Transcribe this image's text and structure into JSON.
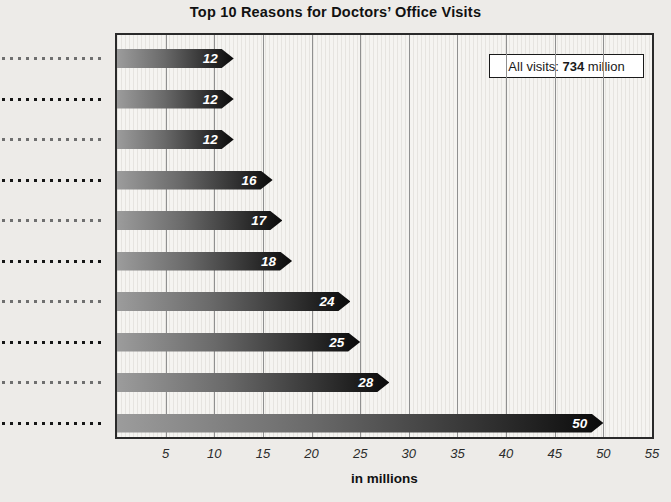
{
  "chart_data": {
    "type": "bar",
    "orientation": "horizontal",
    "title": "Top 10 Reasons for Doctors’ Office Visits",
    "values": [
      12,
      12,
      12,
      16,
      17,
      18,
      24,
      25,
      28,
      50
    ],
    "bar_value_labels": [
      "12",
      "12",
      "12",
      "16",
      "17",
      "18",
      "24",
      "25",
      "28",
      "50"
    ],
    "category_labels_visible": false,
    "category_leader_rows": 10,
    "x_ticks": [
      5,
      10,
      15,
      20,
      25,
      30,
      35,
      40,
      45,
      50,
      55
    ],
    "xlim": [
      0,
      55
    ],
    "xlabel": "in millions",
    "grid": "vertical-major",
    "annotation": {
      "prefix": "All visits: ",
      "value": "734",
      "suffix": " million"
    },
    "colors": {
      "page_bg": "#edebe8",
      "plot_bg": "#f5f4f1",
      "stripe": "#e6e4e0",
      "gridline": "#909090",
      "border": "#2a2a2a",
      "title": "#111111",
      "tick": "#2b2b2b",
      "bar_start": "#9c9c9c",
      "bar_mid": "#6a6a6a",
      "bar_dark": "#2e2e2e",
      "bar_end": "#0a0a0a",
      "value_text": "#ffffff",
      "legend_bg": "#ffffff",
      "legend_border": "#1a1a1a",
      "leader_dark": "#161616",
      "leader_light": "#6f6f6f"
    }
  }
}
